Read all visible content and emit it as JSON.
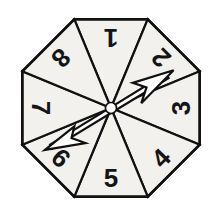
{
  "figure": {
    "name": "octagonal-spinner",
    "background_color": "#ffffff"
  },
  "spinner": {
    "shape": "octagon",
    "sector_count": 8,
    "center": {
      "x": 111,
      "y": 108
    },
    "radius": 96,
    "fill_color": "#f2f1ee",
    "stroke_color": "#111111",
    "outer_stroke_width": 2.6,
    "divider_stroke_width": 2.2,
    "sectors": [
      {
        "label": "1",
        "index": 1,
        "mid_angle_deg": -90,
        "number_rotation_deg": 180,
        "label_x": 111,
        "label_y": 38,
        "is_pointed_to": false
      },
      {
        "label": "2",
        "index": 2,
        "mid_angle_deg": -45,
        "number_rotation_deg": 225,
        "label_x": 161,
        "label_y": 58,
        "is_pointed_to": true
      },
      {
        "label": "3",
        "index": 3,
        "mid_angle_deg": 0,
        "number_rotation_deg": 270,
        "label_x": 181,
        "label_y": 108,
        "is_pointed_to": false
      },
      {
        "label": "4",
        "index": 4,
        "mid_angle_deg": 45,
        "number_rotation_deg": 315,
        "label_x": 161,
        "label_y": 158,
        "is_pointed_to": false
      },
      {
        "label": "5",
        "index": 5,
        "mid_angle_deg": 90,
        "number_rotation_deg": 0,
        "label_x": 111,
        "label_y": 178,
        "is_pointed_to": false
      },
      {
        "label": "6",
        "index": 6,
        "mid_angle_deg": 135,
        "number_rotation_deg": 45,
        "label_x": 61,
        "label_y": 158,
        "is_pointed_to": true
      },
      {
        "label": "7",
        "index": 7,
        "mid_angle_deg": 180,
        "number_rotation_deg": 90,
        "label_x": 41,
        "label_y": 108,
        "is_pointed_to": false
      },
      {
        "label": "8",
        "index": 8,
        "mid_angle_deg": -135,
        "number_rotation_deg": 135,
        "label_x": 61,
        "label_y": 58,
        "is_pointed_to": false
      }
    ]
  },
  "needle": {
    "type": "double-headed-arrow",
    "angle_deg": -28,
    "fill_color": "#ffffff",
    "stroke_color": "#111111",
    "head_points_to_sector": "2",
    "tail_points_to_sector": "6",
    "hub": {
      "x": 111,
      "y": 108,
      "radius": 5.5,
      "fill_color": "#ffffff"
    }
  }
}
